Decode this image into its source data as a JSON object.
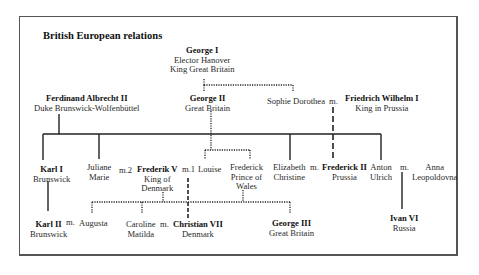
{
  "title": "British European relations",
  "people": {
    "george1": {
      "name": "George I",
      "line1": "Elector Hanover",
      "line2": "King Great Britain"
    },
    "ferdinand": {
      "name": "Ferdinand Albrecht II",
      "line1": "Duke Brunswick-Wolfenbüttel"
    },
    "george2": {
      "name": "George II",
      "line1": "Great Britain"
    },
    "sophie": {
      "line1": "Sophie Dorothea"
    },
    "fw1": {
      "name": "Friedrich Wilhelm I",
      "line1": "King in Prussia"
    },
    "karl1": {
      "name": "Karl I",
      "line1": "Brunswick"
    },
    "juliane": {
      "line1": "Juliane",
      "line2": "Marie"
    },
    "frederik5": {
      "name": "Frederik V",
      "line1": "King of",
      "line2": "Denmark"
    },
    "louise": {
      "line1": "Louise"
    },
    "fpw": {
      "line1": "Frederick",
      "line2": "Prince of",
      "line3": "Wales"
    },
    "elizabeth": {
      "line1": "Elizabeth",
      "line2": "Christine"
    },
    "frederick2": {
      "name": "Frederick II",
      "line1": "Prussia"
    },
    "anton": {
      "line1": "Anton",
      "line2": "Ulrich"
    },
    "anna": {
      "line1": "Anna",
      "line2": "Leopoldovna"
    },
    "karl2": {
      "name": "Karl II",
      "line1": "Brunswick"
    },
    "augusta": {
      "line1": "Augusta"
    },
    "caroline": {
      "line1": "Caroline",
      "line2": "Matilda"
    },
    "christian7": {
      "name": "Christian VII",
      "line1": "Denmark"
    },
    "george3": {
      "name": "George III",
      "line1": "Great Britain"
    },
    "ivan6": {
      "name": "Ivan VI",
      "line1": "Russia"
    }
  },
  "marriages": {
    "sophie_fw": "m.",
    "juliane_frederik": "m.2",
    "frederik_louise": "m.1",
    "elizabeth_frederick": "m.",
    "anton_anna": "m.",
    "karl_augusta": "m.",
    "caroline_christian": "m."
  }
}
